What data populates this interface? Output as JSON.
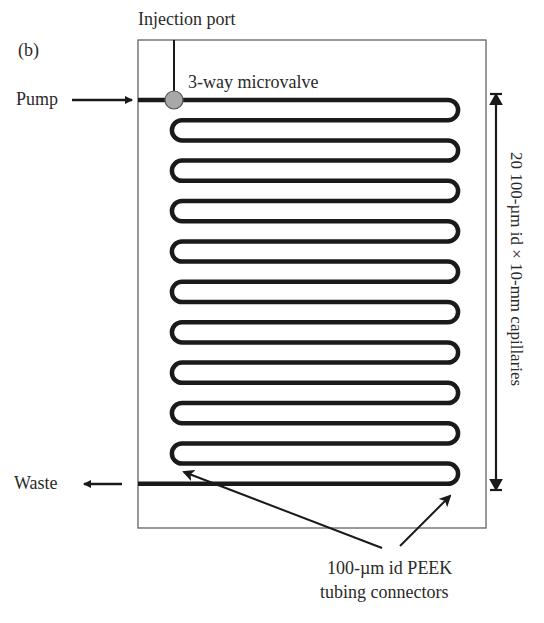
{
  "figure": {
    "panel_label": "(b)",
    "labels": {
      "injection_port": "Injection port",
      "valve": "3-way microvalve",
      "pump": "Pump",
      "waste": "Waste",
      "capillaries": "20 100-µm id × 10-mm capillaries",
      "connectors_line1": "100-µm id PEEK",
      "connectors_line2": "tubing connectors"
    },
    "colors": {
      "line": "#1a1a1a",
      "frame": "#555555",
      "valve_fill": "#a8a8a8"
    },
    "coil": {
      "horizontal_runs": 20,
      "capillary_count": 20
    }
  }
}
